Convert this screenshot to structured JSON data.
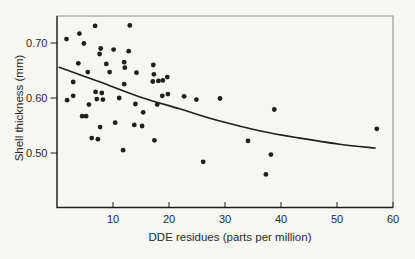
{
  "figure": {
    "background_color": "#f6f6f3",
    "ink_color": "#1f1f1f",
    "frame_color": "#8a8a8a",
    "text_color": "#2b2b2b"
  },
  "chart_data": {
    "type": "scatter",
    "title": "",
    "xlabel": "DDE residues (parts per million)",
    "ylabel": "Shell thickness (mm)",
    "xlim": [
      0,
      60
    ],
    "ylim": [
      0.4,
      0.75
    ],
    "x_ticks": [
      10,
      20,
      30,
      40,
      50,
      60
    ],
    "y_ticks": [
      0.7,
      0.6,
      0.5
    ],
    "y_tick_labels": [
      "0.70",
      "0.60",
      "0.50"
    ],
    "grid": false,
    "legend": "none",
    "marker": {
      "shape": "circle",
      "diameter_px": 5,
      "color": "#1f1f1f"
    },
    "points": [
      [
        1.7,
        0.707
      ],
      [
        4.0,
        0.717
      ],
      [
        6.8,
        0.731
      ],
      [
        4.8,
        0.699
      ],
      [
        7.8,
        0.69
      ],
      [
        7.6,
        0.68
      ],
      [
        10.1,
        0.688
      ],
      [
        13.0,
        0.732
      ],
      [
        12.8,
        0.685
      ],
      [
        3.8,
        0.663
      ],
      [
        5.5,
        0.647
      ],
      [
        8.8,
        0.662
      ],
      [
        9.4,
        0.647
      ],
      [
        12.0,
        0.665
      ],
      [
        12.1,
        0.655
      ],
      [
        14.2,
        0.646
      ],
      [
        17.2,
        0.66
      ],
      [
        17.3,
        0.643
      ],
      [
        17.1,
        0.63
      ],
      [
        18.1,
        0.631
      ],
      [
        18.9,
        0.632
      ],
      [
        19.7,
        0.638
      ],
      [
        12.0,
        0.625
      ],
      [
        2.9,
        0.629
      ],
      [
        2.9,
        0.604
      ],
      [
        1.8,
        0.596
      ],
      [
        6.9,
        0.611
      ],
      [
        8.0,
        0.609
      ],
      [
        7.1,
        0.598
      ],
      [
        8.2,
        0.597
      ],
      [
        5.7,
        0.588
      ],
      [
        4.5,
        0.567
      ],
      [
        5.2,
        0.567
      ],
      [
        10.4,
        0.555
      ],
      [
        7.7,
        0.547
      ],
      [
        13.8,
        0.551
      ],
      [
        15.2,
        0.549
      ],
      [
        6.2,
        0.527
      ],
      [
        7.3,
        0.525
      ],
      [
        11.8,
        0.505
      ],
      [
        14.0,
        0.589
      ],
      [
        15.4,
        0.574
      ],
      [
        17.9,
        0.588
      ],
      [
        18.8,
        0.604
      ],
      [
        19.8,
        0.607
      ],
      [
        22.7,
        0.603
      ],
      [
        24.9,
        0.597
      ],
      [
        29.1,
        0.599
      ],
      [
        11.1,
        0.6
      ],
      [
        17.4,
        0.523
      ],
      [
        26.1,
        0.484
      ],
      [
        34.1,
        0.522
      ],
      [
        37.3,
        0.461
      ],
      [
        38.2,
        0.497
      ],
      [
        38.8,
        0.579
      ],
      [
        57.1,
        0.544
      ]
    ],
    "trend_curve": [
      [
        0.4,
        0.656
      ],
      [
        7.7,
        0.629
      ],
      [
        14.8,
        0.602
      ],
      [
        22.0,
        0.58
      ],
      [
        29.1,
        0.558
      ],
      [
        36.3,
        0.54
      ],
      [
        43.4,
        0.527
      ],
      [
        50.5,
        0.516
      ],
      [
        56.8,
        0.509
      ]
    ]
  }
}
